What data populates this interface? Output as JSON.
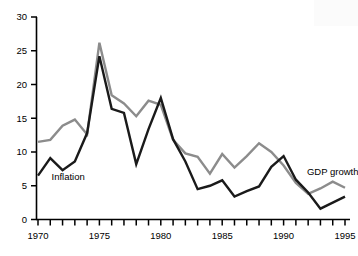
{
  "chart_data": {
    "type": "line",
    "title": "",
    "xlabel": "",
    "ylabel": "",
    "xlim": [
      1970,
      1995
    ],
    "ylim": [
      0,
      30
    ],
    "ytick_labels": [
      "0",
      "5",
      "10",
      "15",
      "20",
      "25",
      "30"
    ],
    "yticks": [
      0,
      5,
      10,
      15,
      20,
      25,
      30
    ],
    "xtick_labels": [
      "1970",
      "1975",
      "1980",
      "1985",
      "1990",
      "1995"
    ],
    "xticks": [
      1970,
      1975,
      1980,
      1985,
      1990,
      1995
    ],
    "minor_xticks_every": 1,
    "grid": false,
    "legend": "inline-annotations",
    "x": [
      1970,
      1971,
      1972,
      1973,
      1974,
      1975,
      1976,
      1977,
      1978,
      1979,
      1980,
      1981,
      1982,
      1983,
      1984,
      1985,
      1986,
      1987,
      1988,
      1989,
      1990,
      1991,
      1992,
      1993,
      1994,
      1995
    ],
    "series": [
      {
        "name": "Inflation",
        "color": "#1a1a1a",
        "values": [
          6.5,
          9.1,
          7.3,
          8.6,
          12.8,
          24.2,
          16.4,
          15.8,
          8.2,
          13.4,
          18.0,
          11.9,
          8.6,
          4.5,
          5.0,
          5.8,
          3.4,
          4.2,
          4.9,
          7.8,
          9.4,
          5.9,
          4.0,
          1.6,
          2.5,
          3.4
        ]
      },
      {
        "name": "GDP growth",
        "color": "#8c8c8c",
        "values": [
          11.5,
          11.8,
          13.9,
          14.8,
          12.6,
          26.2,
          18.4,
          17.2,
          15.3,
          17.6,
          17.0,
          11.8,
          9.8,
          9.3,
          6.8,
          9.7,
          7.7,
          9.4,
          11.3,
          10.0,
          8.0,
          5.4,
          3.8,
          4.6,
          5.6,
          4.7
        ]
      }
    ],
    "annotations": [
      {
        "text": "Inflation",
        "x": 1971.1,
        "y": 5.9
      },
      {
        "text": "GDP growth",
        "x": 1991.9,
        "y": 6.6
      }
    ]
  },
  "axes": {
    "y_axis_name": "value-axis",
    "x_axis_name": "year-axis"
  }
}
